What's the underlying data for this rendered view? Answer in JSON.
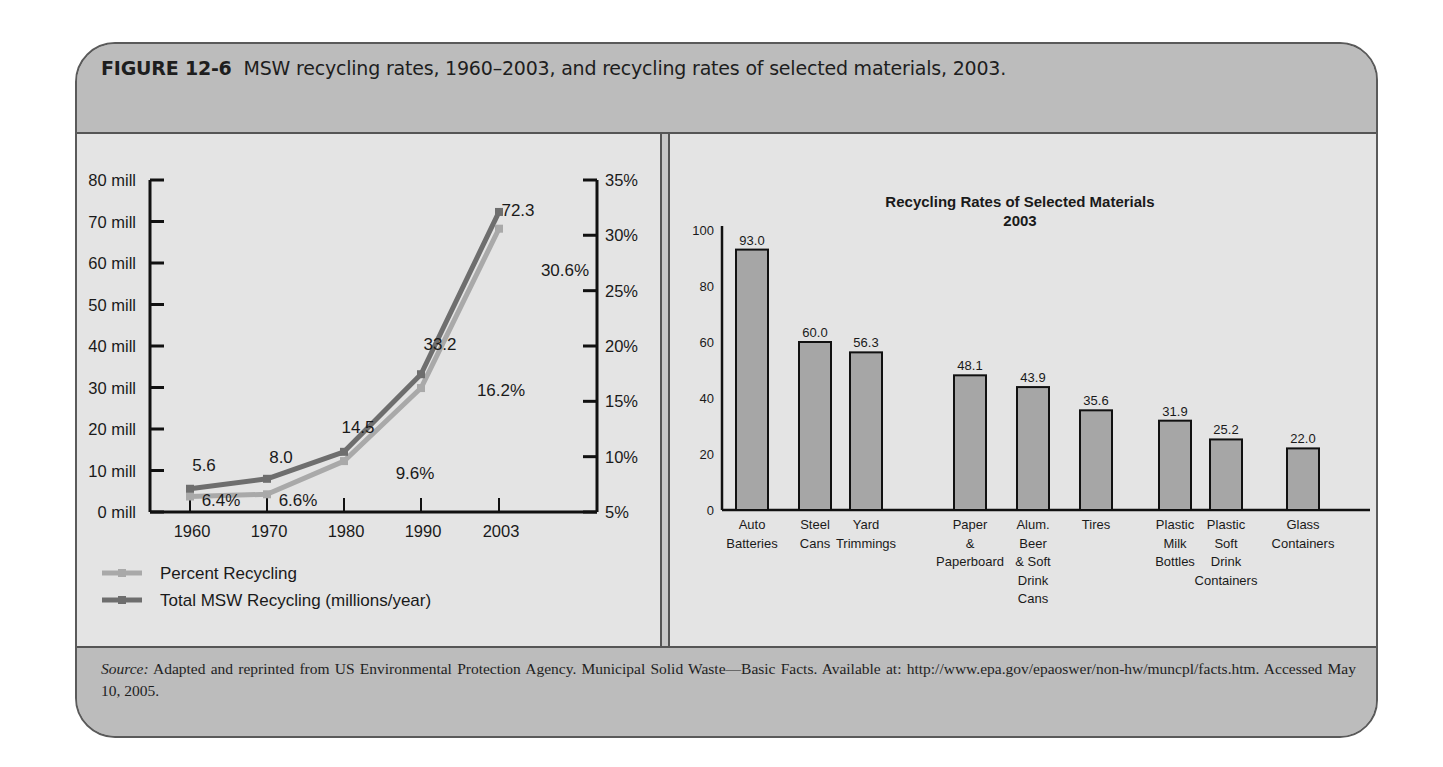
{
  "figure": {
    "number": "FIGURE 12-6",
    "caption": "MSW recycling rates, 1960–2003, and recycling rates of selected materials, 2003.",
    "source_label": "Source:",
    "source_text": " Adapted and reprinted from US Environmental Protection Agency. Municipal Solid Waste—Basic Facts. Available at: http://www.epa.gov/epaoswer/non-hw/muncpl/facts.htm. Accessed May 10, 2005."
  },
  "colors": {
    "total_line": "#6e6e6e",
    "percent_line": "#a9a9a9",
    "bar_fill": "#a6a6a6",
    "panel_bg": "#e4e4e4",
    "frame_bg": "#bcbcbc"
  },
  "chart_data": [
    {
      "type": "line",
      "title": "",
      "xlabel": "",
      "ylabel": "",
      "x": [
        "1960",
        "1970",
        "1980",
        "1990",
        "2003"
      ],
      "left_axis": {
        "ticks": [
          "0 mill",
          "10 mill",
          "20 mill",
          "30 mill",
          "40 mill",
          "50 mill",
          "60 mill",
          "70 mill",
          "80 mill"
        ],
        "ylim": [
          0,
          80
        ]
      },
      "right_axis": {
        "ticks": [
          "5%",
          "10%",
          "15%",
          "20%",
          "25%",
          "30%",
          "35%"
        ],
        "ylim": [
          5,
          35
        ]
      },
      "series": [
        {
          "name": "Percent Recycling",
          "axis": "right",
          "values": [
            6.4,
            6.6,
            9.6,
            16.2,
            30.6
          ],
          "labels": [
            "6.4%",
            "6.6%",
            "9.6%",
            "16.2%",
            "30.6%"
          ]
        },
        {
          "name": "Total MSW Recycling (millions/year)",
          "axis": "left",
          "values": [
            5.6,
            8.0,
            14.5,
            33.2,
            72.3
          ],
          "labels": [
            "5.6",
            "8.0",
            "14.5",
            "33.2",
            "72.3"
          ]
        }
      ],
      "legend": [
        "Percent Recycling",
        "Total MSW Recycling (millions/year)"
      ],
      "legend_position": "bottom-left",
      "grid": false
    },
    {
      "type": "bar",
      "title": "Recycling Rates of Selected Materials",
      "subtitle": "2003",
      "xlabel": "",
      "ylabel": "",
      "ylim": [
        0,
        100
      ],
      "yticks": [
        "0",
        "20",
        "40",
        "60",
        "80",
        "100"
      ],
      "categories": [
        "Auto Batteries",
        "Steel Cans",
        "Yard Trimmings",
        "Paper & Paperboard",
        "Alum. Beer & Soft Drink Cans",
        "Tires",
        "Plastic Milk Bottles",
        "Plastic Soft Drink Containers",
        "Glass Containers"
      ],
      "category_lines": [
        [
          "Auto",
          "Batteries"
        ],
        [
          "Steel",
          "Cans"
        ],
        [
          "Yard",
          "Trimmings"
        ],
        [
          "Paper",
          "&",
          "Paperboard"
        ],
        [
          "Alum.",
          "Beer",
          "& Soft",
          "Drink",
          "Cans"
        ],
        [
          "Tires"
        ],
        [
          "Plastic",
          "Milk",
          "Bottles"
        ],
        [
          "Plastic",
          "Soft",
          "Drink",
          "Containers"
        ],
        [
          "Glass",
          "Containers"
        ]
      ],
      "values": [
        93.0,
        60.0,
        56.3,
        48.1,
        43.9,
        35.6,
        31.9,
        25.2,
        22.0
      ],
      "value_labels": [
        "93.0",
        "60.0",
        "56.3",
        "48.1",
        "43.9",
        "35.6",
        "31.9",
        "25.2",
        "22.0"
      ],
      "grid": false
    }
  ]
}
